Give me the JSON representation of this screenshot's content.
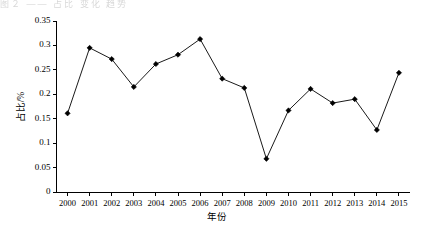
{
  "figure": {
    "background_color": "#ffffff",
    "line_color": "#1a1a1a",
    "marker_color": "#000000",
    "axis_color": "#000000",
    "top_artifact_text": "图２ —— 占比 变化 趋势"
  },
  "chart_data": {
    "type": "line",
    "title": "",
    "xlabel": "年份",
    "ylabel": "占比/%",
    "categories": [
      "2000",
      "2001",
      "2002",
      "2003",
      "2004",
      "2005",
      "2006",
      "2007",
      "2008",
      "2009",
      "2010",
      "2011",
      "2012",
      "2013",
      "2014",
      "2015"
    ],
    "values": [
      0.161,
      0.295,
      0.272,
      0.215,
      0.262,
      0.281,
      0.313,
      0.232,
      0.213,
      0.068,
      0.167,
      0.211,
      0.182,
      0.19,
      0.127,
      0.244
    ],
    "series": [
      {
        "name": "占比/%",
        "values": [
          0.161,
          0.295,
          0.272,
          0.215,
          0.262,
          0.281,
          0.313,
          0.232,
          0.213,
          0.068,
          0.167,
          0.211,
          0.182,
          0.19,
          0.127,
          0.244
        ]
      }
    ],
    "ylim": [
      0,
      0.35
    ],
    "yticks": [
      0,
      0.05,
      0.1,
      0.15,
      0.2,
      0.25,
      0.3,
      0.35
    ],
    "ytick_labels": [
      "0",
      "0.05",
      "0.1",
      "0.15",
      "0.2",
      "0.25",
      "0.3",
      "0.35"
    ],
    "xtick_labels": [
      "2000",
      "2001",
      "2002",
      "2003",
      "2004",
      "2005",
      "2006",
      "2007",
      "2008",
      "2009",
      "2010",
      "2011",
      "2012",
      "2013",
      "2014",
      "2015"
    ],
    "grid": false,
    "legend": false,
    "legend_position": "none",
    "marker": "diamond",
    "annotations": []
  }
}
